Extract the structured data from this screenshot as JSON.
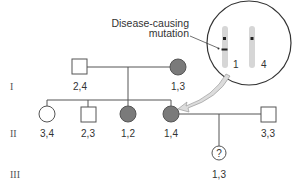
{
  "diagram": {
    "type": "pedigree",
    "colors": {
      "line": "#555555",
      "affected_fill": "#7a7a7a",
      "unaffected_fill": "#ffffff",
      "chromosome": "#d6d6d6",
      "arrow_fill": "#dcdcdc",
      "text": "#333333"
    },
    "callout": {
      "line1": "Disease-causing",
      "line2": "mutation"
    },
    "inset": {
      "chromosomes": [
        {
          "label": "1",
          "has_mutation": true
        },
        {
          "label": "4",
          "has_mutation": false
        }
      ]
    },
    "generations": [
      {
        "label": "I"
      },
      {
        "label": "II"
      },
      {
        "label": "III"
      }
    ],
    "individuals": {
      "gen1_father": {
        "sex": "male",
        "affected": false,
        "genotype": "2,4"
      },
      "gen1_mother": {
        "sex": "female",
        "affected": true,
        "genotype": "1,3"
      },
      "gen2_daughter1": {
        "sex": "female",
        "affected": false,
        "genotype": "3,4"
      },
      "gen2_son": {
        "sex": "male",
        "affected": false,
        "genotype": "2,3"
      },
      "gen2_daughter2": {
        "sex": "female",
        "affected": true,
        "genotype": "1,2"
      },
      "gen2_daughter3": {
        "sex": "female",
        "affected": true,
        "genotype": "1,4"
      },
      "gen2_spouse": {
        "sex": "male",
        "affected": false,
        "genotype": "3,3"
      },
      "gen3_child": {
        "sex": "female",
        "affected": "unknown",
        "symbol": "?",
        "genotype": "1,3"
      }
    }
  }
}
